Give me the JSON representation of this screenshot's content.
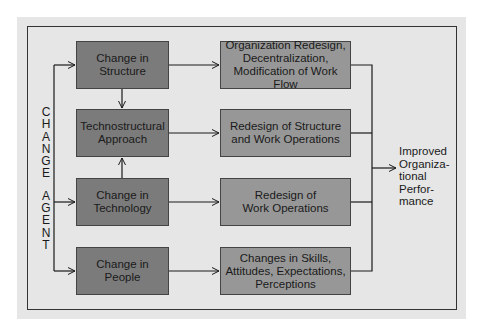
{
  "diagram": {
    "change_agent_label": "CHANGE AGENT",
    "change_agent_letters_1": [
      "C",
      "H",
      "A",
      "N",
      "G",
      "E"
    ],
    "change_agent_letters_2": [
      "A",
      "G",
      "E",
      "N",
      "T"
    ],
    "approaches": [
      {
        "label": "Change in\nStructure"
      },
      {
        "label": "Technostructural\nApproach"
      },
      {
        "label": "Change in\nTechnology"
      },
      {
        "label": "Change in\nPeople"
      }
    ],
    "outcomes": [
      {
        "label": "Organization Redesign,\nDecentralization,\nModification of Work Flow"
      },
      {
        "label": "Redesign of Structure\nand Work Operations"
      },
      {
        "label": "Redesign of\nWork Operations"
      },
      {
        "label": "Changes in Skills,\nAttitudes, Expectations,\nPerceptions"
      }
    ],
    "result": "Improved\nOrganiza-\ntional\nPerfor-\nmance",
    "colors": {
      "panel": "#e6e6e6",
      "approach_box": "#7b7b7b",
      "outcome_box": "#979797",
      "line": "#1a1a1a"
    }
  }
}
